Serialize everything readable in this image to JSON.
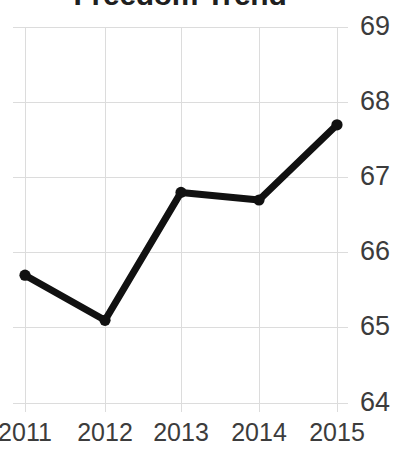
{
  "chart_data": {
    "type": "line",
    "title": "Freedom Trend",
    "xlabel": "",
    "ylabel": "",
    "categories": [
      "2011",
      "2012",
      "2013",
      "2014",
      "2015"
    ],
    "x": [
      2011,
      2012,
      2013,
      2014,
      2015
    ],
    "values": [
      65.7,
      65.1,
      66.8,
      66.7,
      67.7
    ],
    "series": [
      {
        "name": "Freedom Trend",
        "values": [
          65.7,
          65.1,
          66.8,
          66.7,
          67.7
        ]
      }
    ],
    "ylim": [
      64,
      69
    ],
    "xlim": [
      "2011",
      "2015"
    ],
    "yticks": [
      "69",
      "68",
      "67",
      "66",
      "65",
      "64"
    ],
    "ytick_values": [
      69,
      68,
      67,
      66,
      65,
      64
    ],
    "xticks": [
      "2011",
      "2012",
      "2013",
      "2014",
      "2015"
    ],
    "grid": true,
    "y_axis_position": "right",
    "legend": false,
    "legend_position": "none",
    "markers": true,
    "colors": {
      "line": "#111111",
      "marker": "#111111",
      "grid": "#dcdcdc",
      "tick_label": "#3c3c3c",
      "title": "#1f1f1f",
      "background": "#ffffff"
    }
  },
  "axis": {
    "y_labels": [
      "69",
      "68",
      "67",
      "66",
      "65",
      "64"
    ],
    "x_labels": [
      "2011",
      "2012",
      "2013",
      "2014",
      "2015"
    ]
  }
}
